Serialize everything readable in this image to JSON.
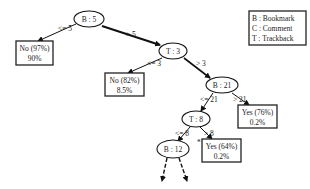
{
  "diagram": {
    "type": "decision-tree",
    "legend": {
      "items": [
        "B : Bookmark",
        "C : Comment",
        "T : Trackback"
      ]
    },
    "nodes": {
      "n_b5": {
        "label": "B : 5"
      },
      "n_t3": {
        "label": "T : 3"
      },
      "n_b21": {
        "label": "B : 21"
      },
      "n_t8": {
        "label": "T : 8"
      },
      "n_b12": {
        "label": "B : 12"
      }
    },
    "leaves": {
      "leaf_no97": {
        "line1": "No (97%)",
        "line2": "90%"
      },
      "leaf_no82": {
        "line1": "No (82%)",
        "line2": "8.5%"
      },
      "leaf_yes76": {
        "line1": "Yes (76%)",
        "line2": "0.2%"
      },
      "leaf_yes64": {
        "line1": "Yes (64%)",
        "line2": "0.2%"
      }
    },
    "edges": {
      "e_b5_le": "<= 5",
      "e_b5_gt": "> 5",
      "e_t3_le": "<= 3",
      "e_t3_gt": "> 3",
      "e_b21_le": "<= 21",
      "e_b21_gt": "> 21",
      "e_t8_le": "<= 8",
      "e_t8_gt": "> 8"
    },
    "marker": "*"
  }
}
